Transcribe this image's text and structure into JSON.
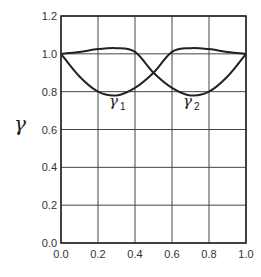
{
  "chart_data": {
    "type": "line",
    "title": "",
    "xlabel": "",
    "ylabel": "γ",
    "xlim": [
      0.0,
      1.0
    ],
    "ylim": [
      0.0,
      1.2
    ],
    "grid": true,
    "xticks": [
      "0.0",
      "0.2",
      "0.4",
      "0.6",
      "0.8",
      "1.0"
    ],
    "yticks": [
      "0.0",
      "0.2",
      "0.4",
      "0.6",
      "0.8",
      "1.0",
      "1.2"
    ],
    "series": [
      {
        "name": "γ1 upper branch",
        "label": "γ",
        "sub": "1",
        "x": [
          0.0,
          0.1,
          0.2,
          0.3,
          0.4,
          0.5,
          0.6,
          0.7,
          0.8,
          0.9,
          1.0
        ],
        "y": [
          1.0,
          1.01,
          1.025,
          1.03,
          1.01,
          0.9,
          0.82,
          0.78,
          0.8,
          0.88,
          1.0
        ]
      },
      {
        "name": "γ2",
        "label": "γ",
        "sub": "2",
        "x": [
          0.0,
          0.1,
          0.2,
          0.3,
          0.4,
          0.5,
          0.6,
          0.7,
          0.8,
          0.9,
          1.0
        ],
        "y": [
          1.0,
          0.88,
          0.8,
          0.78,
          0.82,
          0.9,
          1.01,
          1.03,
          1.025,
          1.01,
          1.0
        ]
      }
    ],
    "annotations": [
      {
        "text": "γ1",
        "x": 0.3,
        "y": 0.7
      },
      {
        "text": "γ2",
        "x": 0.7,
        "y": 0.7
      }
    ]
  },
  "labels": {
    "ylabel": "γ",
    "gamma": "γ",
    "sub1": "1",
    "sub2": "2"
  }
}
